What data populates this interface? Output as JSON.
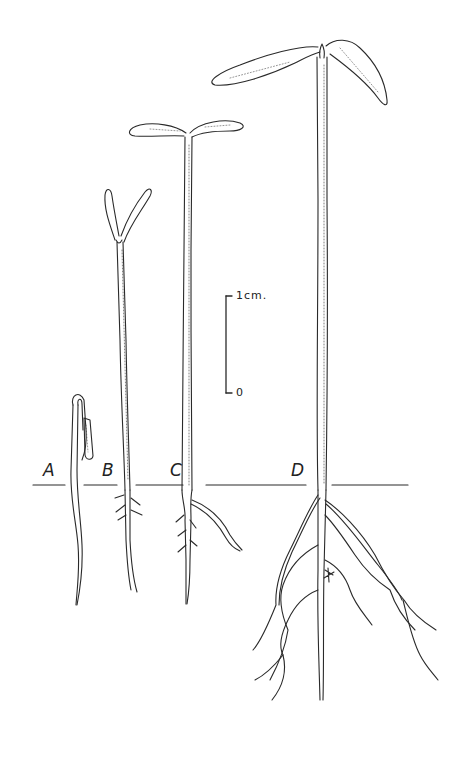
{
  "figure": {
    "ink_color": "#2a2a2a",
    "background": "#ffffff"
  },
  "seedlings": [
    {
      "id": "A",
      "label": "A",
      "stage": "hooked hypocotyl emerging"
    },
    {
      "id": "B",
      "label": "B",
      "stage": "cotyledons unfolding"
    },
    {
      "id": "C",
      "label": "C",
      "stage": "cotyledons open"
    },
    {
      "id": "D",
      "label": "D",
      "stage": "expanded cotyledons with branched roots"
    }
  ],
  "scale_bar": {
    "top_label": "1cm.",
    "bottom_label": "0"
  }
}
